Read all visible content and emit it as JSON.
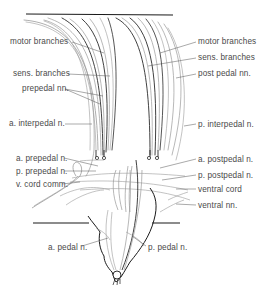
{
  "figure": {
    "colors": {
      "ink": "#1a1a1a",
      "nerve_dark": "#2b2b2b",
      "nerve_light": "#9a9a9a",
      "label_text": "#4a4a4a",
      "leader": "#555555"
    },
    "labels_left": [
      {
        "id": "motor-branches-left",
        "text": "motor branches",
        "x": 10,
        "y": 38
      },
      {
        "id": "sens-branches-left",
        "text": "sens. branches",
        "x": 13,
        "y": 70
      },
      {
        "id": "prepedal-nn",
        "text": "prepedal nn.",
        "x": 22,
        "y": 86
      },
      {
        "id": "a-interpedal-n",
        "text": "a. interpedal n.",
        "x": 9,
        "y": 120
      },
      {
        "id": "a-prepedal-n",
        "text": "a. prepedal n.",
        "x": 16,
        "y": 155
      },
      {
        "id": "p-prepedal-n",
        "text": "p. prepedal n.",
        "x": 16,
        "y": 168
      },
      {
        "id": "v-cord-comm",
        "text": "v. cord comm.",
        "x": 16,
        "y": 181
      },
      {
        "id": "a-pedal-n",
        "text": "a. pedal n.",
        "x": 48,
        "y": 244
      }
    ],
    "labels_right": [
      {
        "id": "motor-branches-right",
        "text": "motor branches",
        "x": 198,
        "y": 38
      },
      {
        "id": "sens-branches-right",
        "text": "sens. branches",
        "x": 198,
        "y": 54
      },
      {
        "id": "post-pedal-nn",
        "text": "post pedal nn.",
        "x": 198,
        "y": 70
      },
      {
        "id": "p-interpedal-n",
        "text": "p. interpedal n.",
        "x": 198,
        "y": 121
      },
      {
        "id": "a-postpedal-n",
        "text": "a. postpedal n.",
        "x": 198,
        "y": 156
      },
      {
        "id": "p-postpedal-n",
        "text": "p. postpedal n.",
        "x": 198,
        "y": 172
      },
      {
        "id": "ventral-cord",
        "text": "ventral cord",
        "x": 198,
        "y": 186
      },
      {
        "id": "ventral-nn",
        "text": "ventral nn.",
        "x": 198,
        "y": 202
      },
      {
        "id": "p-pedal-n",
        "text": "p. pedal n.",
        "x": 148,
        "y": 244
      }
    ]
  }
}
